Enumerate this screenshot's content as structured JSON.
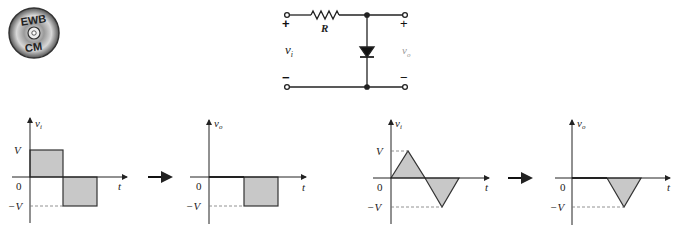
{
  "logo": {
    "top": "EWB",
    "bottom": "CM"
  },
  "circuit": {
    "resistor_label": "R",
    "input_label": "v",
    "input_sub": "i",
    "output_label": "v",
    "output_sub": "o",
    "plus": "+",
    "minus": "−"
  },
  "graphs": [
    {
      "id": "square-input",
      "ylabel": "v",
      "ysub": "i",
      "xlabel": "t",
      "ticks": {
        "pos": "V",
        "zero": "0",
        "neg": "−V"
      }
    },
    {
      "id": "square-output",
      "ylabel": "v",
      "ysub": "o",
      "xlabel": "t",
      "ticks": {
        "zero": "0",
        "neg": "−V"
      }
    },
    {
      "id": "triangle-input",
      "ylabel": "v",
      "ysub": "i",
      "xlabel": "t",
      "ticks": {
        "pos": "V",
        "zero": "0",
        "neg": "−V"
      }
    },
    {
      "id": "triangle-output",
      "ylabel": "v",
      "ysub": "o",
      "xlabel": "t",
      "ticks": {
        "zero": "0",
        "neg": "−V"
      }
    }
  ],
  "colors": {
    "fill": "#c8c8c8",
    "stroke": "#333333",
    "dash": "#777777"
  }
}
